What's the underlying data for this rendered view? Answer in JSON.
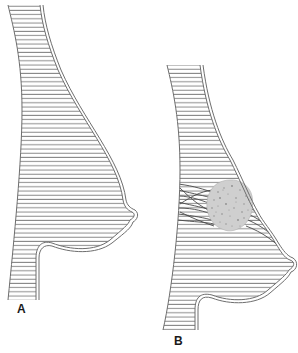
{
  "figure": {
    "panels": [
      {
        "id": "A",
        "label": "A",
        "description": "Normal breast, sagittal profile",
        "has_tumor": false
      },
      {
        "id": "B",
        "label": "B",
        "description": "Breast with tumor and fibrous strands causing skin retraction",
        "has_tumor": true
      }
    ]
  },
  "colors": {
    "outline": "#6e6e6e",
    "hatch": "#8a8a8a",
    "tumor_fill": "#cfcfcf",
    "tumor_speckle": "#8c8c8c",
    "strands": "#4a4a4a",
    "background": "#ffffff"
  }
}
